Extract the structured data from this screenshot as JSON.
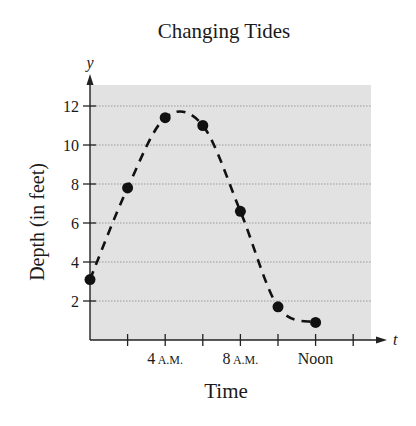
{
  "chart_data": {
    "type": "line",
    "title": "Changing Tides",
    "xlabel": "Time",
    "ylabel": "Depth (in feet)",
    "x_axis_var": "t",
    "y_axis_var": "y",
    "x_unit": "hours after midnight",
    "x": [
      0,
      2,
      4,
      6,
      8,
      10,
      12
    ],
    "series": [
      {
        "name": "Depth",
        "values": [
          3.1,
          7.8,
          11.4,
          11.0,
          6.6,
          1.7,
          0.9
        ],
        "style": "dashed smooth curve with filled markers"
      }
    ],
    "x_ticks": [
      0,
      2,
      4,
      6,
      8,
      10,
      12,
      14
    ],
    "x_tick_labels": [
      {
        "value": 4,
        "main": "4",
        "suffix": "A.M."
      },
      {
        "value": 8,
        "main": "8",
        "suffix": "A.M."
      },
      {
        "value": 12,
        "main": "Noon",
        "suffix": ""
      }
    ],
    "y_ticks": [
      2,
      4,
      6,
      8,
      10,
      12
    ],
    "y_tick_labels": [
      "2",
      "4",
      "6",
      "8",
      "10",
      "12"
    ],
    "xlim": [
      0,
      15
    ],
    "ylim": [
      0,
      13
    ],
    "grid": "horizontal dotted",
    "background": "#e2e2e2",
    "legend": null
  },
  "labels": {
    "title": "Changing Tides",
    "xlabel": "Time",
    "ylabel": "Depth (in feet)",
    "x_var": "t",
    "y_var": "y"
  }
}
